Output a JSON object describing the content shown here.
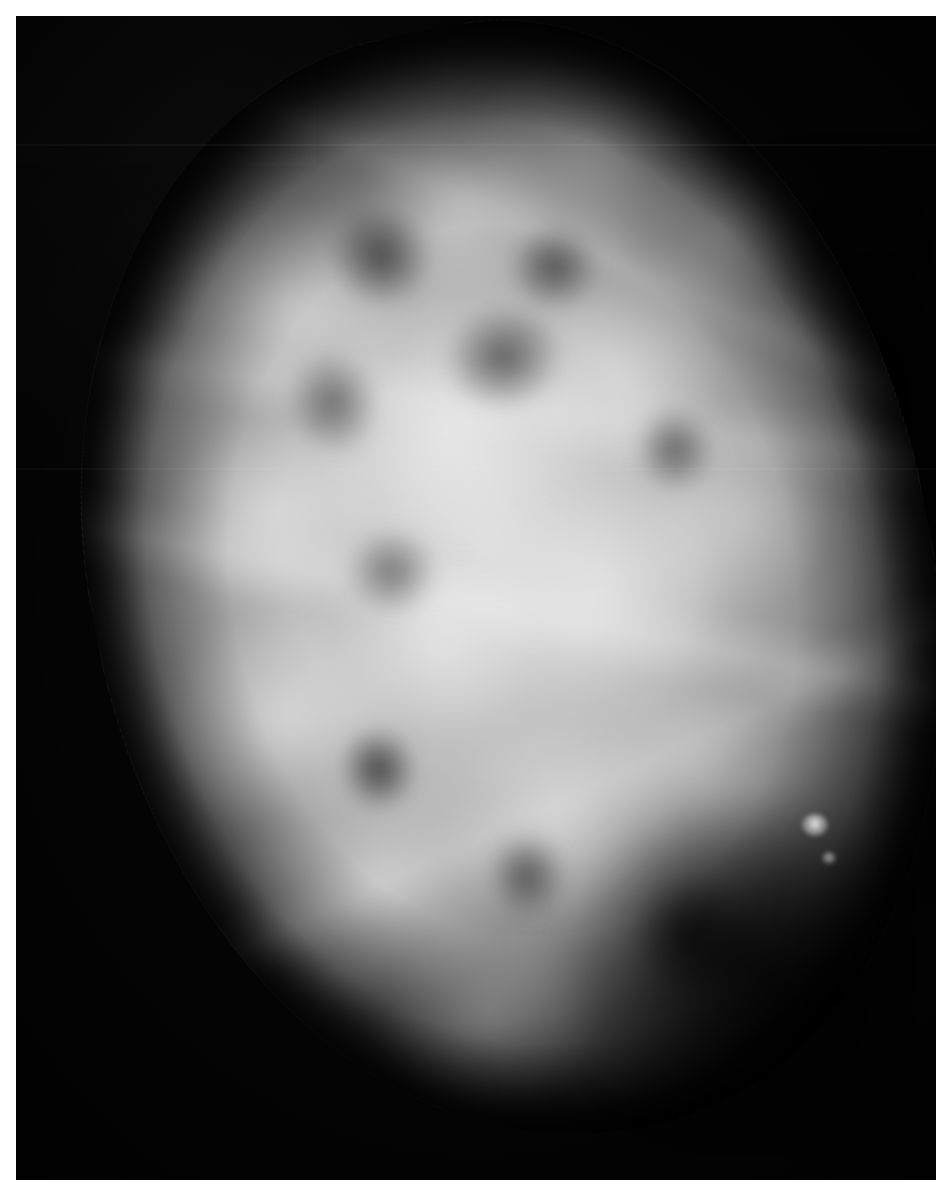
{
  "image": {
    "modality": "mammography",
    "view_description": "single-breast mammographic projection, oblique orientation",
    "title": "",
    "caption": "",
    "frame": {
      "canvas_width_px": 949,
      "canvas_height_px": 1194,
      "paper_margin_px": 16,
      "film_left_px": 16,
      "film_top_px": 16,
      "film_width_px": 920,
      "film_height_px": 1164,
      "paper_color": "#ffffff",
      "background_color": "#050505"
    },
    "palette": {
      "air_black": "#030303",
      "skin_edge_gray": "#3c3c3c",
      "fat_gray": "#6e6e6e",
      "parenchyma_gray": "#b4b4b4",
      "dense_tissue_white": "#e6e6e6",
      "calcification_white": "#ffffff"
    },
    "anatomy": {
      "breast_outline": {
        "center_x_pct": 50,
        "center_y_pct": 49,
        "width_px": 838,
        "height_px": 1118,
        "rotation_deg": -11,
        "apex_location": "upper-right",
        "convex_border": "left"
      },
      "regions": [
        {
          "name": "fibroglandular-tissue",
          "appearance": "heterogeneously dense, cloud-like confluent opacities",
          "location": "central and upper breast"
        },
        {
          "name": "fat-lucency",
          "appearance": "darker rounded lobules interspersed between glandular bands",
          "location": "scattered throughout parenchyma"
        },
        {
          "name": "retroglandular-fat",
          "appearance": "low-density dark wedge",
          "location": "posterior / right aspect"
        },
        {
          "name": "inframammary-fat",
          "appearance": "dark region below the glandular cone",
          "location": "lower-right"
        },
        {
          "name": "radiodense-focus",
          "appearance": "small punctate bright density",
          "location": "lower-right quadrant",
          "x_pct": 86,
          "y_pct": 69
        },
        {
          "name": "focal-lucency",
          "appearance": "small rounded dark area",
          "location": "central-left",
          "x_pct": 39,
          "y_pct": 58
        }
      ],
      "artifacts": [
        {
          "name": "scan-line",
          "description": "faint horizontal digitization line",
          "y_pct": 11
        },
        {
          "name": "scan-line",
          "description": "faint horizontal digitization line",
          "y_pct": 39
        }
      ]
    }
  }
}
